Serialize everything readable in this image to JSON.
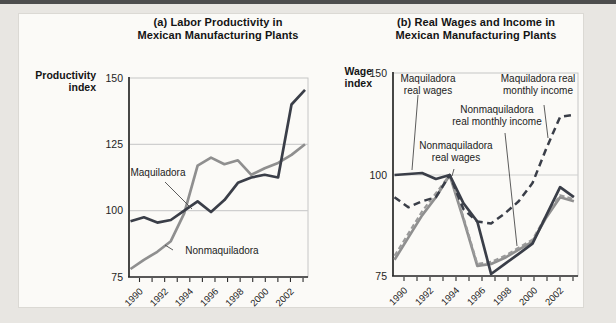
{
  "figure": {
    "panels": [
      {
        "id": "a",
        "title_lines": [
          "(a) Labor Productivity in",
          "Mexican Manufacturing Plants"
        ],
        "y_axis_title_lines": [
          "Productivity",
          "index"
        ]
      },
      {
        "id": "b",
        "title_lines": [
          "(b) Real Wages and Income in",
          "Mexican Manufacturing Plants"
        ],
        "y_axis_title_lines": [
          "Wage",
          "index"
        ]
      }
    ]
  },
  "colors": {
    "navy": "#3a3e48",
    "gray": "#8f8f8f",
    "gray_dash": "#9a9a9a",
    "gridline": "#cfcfcf",
    "box_border": "#c6c6c6",
    "axis": "#2b2b2b",
    "leader": "#4a4a4a",
    "tick_text": "#1e1e1e"
  },
  "chart_data": [
    {
      "panel": "a",
      "type": "line",
      "title": "(a) Labor Productivity in Mexican Manufacturing Plants",
      "ylabel": "Productivity index",
      "ylim": [
        75,
        150
      ],
      "x": [
        1990,
        1991,
        1992,
        1993,
        1994,
        1995,
        1996,
        1997,
        1998,
        1999,
        2000,
        2001,
        2002,
        2003
      ],
      "xtick_labels": [
        "1990",
        "",
        "1992",
        "",
        "1994",
        "",
        "1996",
        "",
        "1998",
        "",
        "2000",
        "",
        "2002",
        ""
      ],
      "yticks": [
        {
          "v": 150,
          "label": "150"
        },
        {
          "v": 125,
          "label": "125"
        },
        {
          "v": 100,
          "label": "100"
        },
        {
          "v": 75,
          "label": "75"
        }
      ],
      "gridlines": [
        125,
        100
      ],
      "series": [
        {
          "name": "Nonmaquiladora",
          "style": "gray-solid",
          "values": [
            78,
            81.5,
            84.5,
            88.5,
            99,
            117,
            120,
            117.5,
            119,
            113.5,
            116,
            118,
            121,
            125
          ]
        },
        {
          "name": "Maquiladora",
          "style": "navy-solid",
          "values": [
            96,
            97.5,
            95.5,
            96.5,
            100,
            103.5,
            99.5,
            104,
            110.5,
            112.5,
            113.5,
            112.5,
            140,
            145.5
          ]
        }
      ],
      "annotations": [
        {
          "lines": [
            "Maquiladora"
          ],
          "x": 158,
          "y": 176,
          "leader": [
            165,
            182,
            192,
            209
          ]
        },
        {
          "lines": [
            "Nonmaquiladora"
          ],
          "x": 222,
          "y": 254,
          "leader": [
            173,
            250,
            165,
            245
          ]
        }
      ]
    },
    {
      "panel": "b",
      "type": "line",
      "title": "(b) Real Wages and Income in Mexican Manufacturing Plants",
      "ylabel": "Wage index",
      "ylim": [
        75,
        150
      ],
      "x": [
        1990,
        1991,
        1992,
        1993,
        1994,
        1995,
        1996,
        1997,
        1998,
        1999,
        2000,
        2001,
        2002,
        2003
      ],
      "xtick_labels": [
        "1990",
        "",
        "1992",
        "",
        "1994",
        "",
        "1996",
        "",
        "1998",
        "",
        "2000",
        "",
        "2002",
        ""
      ],
      "yticks": [
        {
          "v": 150,
          "label": "150"
        },
        {
          "v": 100,
          "label": "100"
        },
        {
          "v": 75,
          "label": "75"
        }
      ],
      "gridlines": [
        100
      ],
      "series": [
        {
          "name": "Nonmaquiladora real wages",
          "style": "gray-solid",
          "values": [
            79,
            84.5,
            90,
            94.5,
            100,
            89,
            77.5,
            78,
            79.5,
            81.5,
            83.5,
            89.5,
            94.5,
            93.5
          ]
        },
        {
          "name": "Nonmaquiladora real monthly income",
          "style": "gray-dashed",
          "values": [
            80,
            85.5,
            91,
            95.5,
            100,
            89.5,
            78,
            78.5,
            80,
            82,
            84,
            90,
            95,
            94
          ]
        },
        {
          "name": "Maquiladora real monthly income",
          "style": "navy-dashed",
          "values": [
            94.5,
            92,
            93.5,
            94.5,
            100,
            91.5,
            88.5,
            88,
            90.5,
            93.5,
            98,
            113,
            128.5,
            129.5
          ]
        },
        {
          "name": "Maquiladora real wages",
          "style": "navy-solid",
          "values": [
            100,
            100.5,
            101,
            99,
            100,
            93,
            88.5,
            75.5,
            78,
            80.5,
            83,
            90,
            97,
            94.5
          ]
        }
      ],
      "annotations": [
        {
          "lines": [
            "Maquiladora",
            "real wages"
          ],
          "x": 428,
          "y": 82,
          "leader": [
            418,
            95,
            412,
            170
          ]
        },
        {
          "lines": [
            "Maquiladora real",
            "monthly income"
          ],
          "x": 538,
          "y": 82,
          "leader": [
            544,
            105,
            548,
            138
          ]
        },
        {
          "lines": [
            "Nonmaquiladora",
            "real monthly income"
          ],
          "x": 497,
          "y": 113,
          "leader": [
            505,
            133,
            517,
            246
          ]
        },
        {
          "lines": [
            "Nonmaquiladora",
            "real wages"
          ],
          "x": 456,
          "y": 149,
          "leader": [
            454,
            169,
            452,
            176
          ]
        }
      ]
    }
  ]
}
